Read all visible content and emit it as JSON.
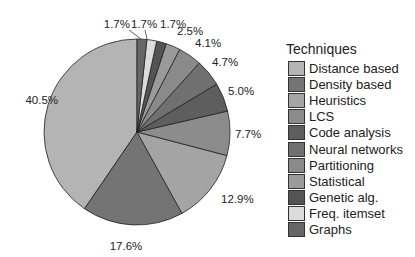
{
  "chart_data": {
    "type": "pie",
    "title": "",
    "legend_title": "Techniques",
    "legend_position": "right",
    "direction": "counter-clockwise from 12 o'clock in legend order",
    "categories": [
      "Distance based",
      "Density based",
      "Heuristics",
      "LCS",
      "Code analysis",
      "Neural networks",
      "Partitioning",
      "Statistical",
      "Genetic alg.",
      "Freq. itemset",
      "Graphs"
    ],
    "values": [
      40.5,
      17.6,
      12.9,
      7.7,
      5.0,
      4.7,
      4.1,
      2.5,
      1.7,
      1.7,
      1.7
    ],
    "labels": [
      "40.5%",
      "17.6%",
      "12.9%",
      "7.7%",
      "5.0%",
      "4.7%",
      "4.1%",
      "2.5%",
      "1.7%",
      "1.7%",
      "1.7%"
    ],
    "colors": [
      "#b4b4b4",
      "#747474",
      "#a4a4a4",
      "#8c8c8c",
      "#5e5e5e",
      "#707070",
      "#8a8a8a",
      "#9a9a9a",
      "#545454",
      "#dcdcdc",
      "#666666"
    ]
  },
  "legend": {
    "title": "Techniques",
    "items": [
      {
        "label": "Distance based",
        "color": "#b4b4b4"
      },
      {
        "label": "Density based",
        "color": "#747474"
      },
      {
        "label": "Heuristics",
        "color": "#a4a4a4"
      },
      {
        "label": "LCS",
        "color": "#8c8c8c"
      },
      {
        "label": "Code analysis",
        "color": "#5e5e5e"
      },
      {
        "label": "Neural networks",
        "color": "#707070"
      },
      {
        "label": "Partitioning",
        "color": "#8a8a8a"
      },
      {
        "label": "Statistical",
        "color": "#9a9a9a"
      },
      {
        "label": "Genetic alg.",
        "color": "#545454"
      },
      {
        "label": "Freq. itemset",
        "color": "#dcdcdc"
      },
      {
        "label": "Graphs",
        "color": "#666666"
      }
    ]
  }
}
